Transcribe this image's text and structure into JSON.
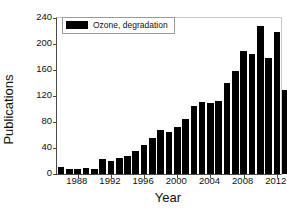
{
  "chart_data": {
    "type": "bar",
    "title": "",
    "xlabel": "Year",
    "ylabel": "Publications",
    "legend": [
      {
        "label": "Ozone, degradation",
        "color": "#000000"
      }
    ],
    "legend_position": "top-left",
    "grid": false,
    "xlim": [
      1985.5,
      2012.5
    ],
    "ylim": [
      0,
      240
    ],
    "ytick_values": [
      0,
      40,
      80,
      120,
      160,
      200,
      240
    ],
    "ytick_labels": [
      "0",
      "40",
      "80",
      "120",
      "160",
      "200",
      "240"
    ],
    "xtick_values": [
      1988,
      1992,
      1996,
      2000,
      2004,
      2008,
      2012
    ],
    "xtick_labels": [
      "1988",
      "1992",
      "1996",
      "2000",
      "2004",
      "2008",
      "2012"
    ],
    "categories": [
      1986,
      1987,
      1988,
      1989,
      1990,
      1991,
      1992,
      1993,
      1994,
      1995,
      1996,
      1997,
      1998,
      1999,
      2000,
      2001,
      2002,
      2003,
      2004,
      2005,
      2006,
      2007,
      2008,
      2009,
      2010,
      2011,
      2012
    ],
    "series": [
      {
        "name": "Ozone, degradation",
        "color": "#000000",
        "values": [
          11,
          8,
          8,
          10,
          7,
          23,
          20,
          25,
          28,
          36,
          45,
          56,
          68,
          65,
          72,
          84,
          105,
          111,
          109,
          113,
          140,
          158,
          189,
          184,
          227,
          179,
          218
        ]
      }
    ],
    "extra_bar": {
      "year": 2012,
      "value": 129,
      "note": "final partial-year bar"
    }
  },
  "axes": {
    "x_title": "Year",
    "y_title": "Publications"
  },
  "legend_box": {
    "swatch_name": "legend-color-swatch",
    "label": "Ozone, degradation"
  }
}
